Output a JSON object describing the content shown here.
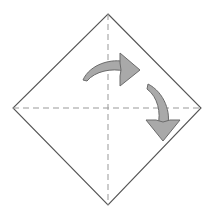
{
  "canvas": {
    "width": 209,
    "height": 214,
    "background_color": "#ffffff",
    "title": "Origami fold step diagram"
  },
  "figure": {
    "name": "diamond-square",
    "stroke_color": "#555555",
    "stroke_width": 1.1,
    "fill": "none",
    "vertices": {
      "top": {
        "x": 108,
        "y": 14
      },
      "left": {
        "x": 13,
        "y": 108
      },
      "right": {
        "x": 201,
        "y": 108
      },
      "bottom": {
        "x": 108,
        "y": 205
      }
    },
    "points_path": "108,14 201,108 108,205 13,108"
  },
  "fold_lines": [
    {
      "name": "vertical-fold-line",
      "orientation": "vertical",
      "style": "dashed",
      "color": "#999999",
      "stroke_width": 1,
      "dash_pattern": "6 4",
      "x1": 108,
      "y1": 14,
      "x2": 108,
      "y2": 205
    },
    {
      "name": "horizontal-fold-line",
      "orientation": "horizontal",
      "style": "dashed",
      "color": "#999999",
      "stroke_width": 1,
      "dash_pattern": "6 4",
      "x1": 13,
      "y1": 108,
      "x2": 201,
      "y2": 108
    }
  ],
  "arrows": [
    {
      "name": "upper-curved-arrow-right",
      "direction": "right",
      "meaning": "rotate / fold toward the right",
      "fill_color": "#a9a9a9",
      "stroke_color": "#6b6b6b",
      "stroke_width": 1,
      "body_path": "M 83 80 C 90 64 112 58 126 62 L 124 71 C 112 68 95 71 87 81 Z",
      "head_path": "M 120 53 L 140 70 L 120 86 L 120 76 L 121 70 L 120 63 Z"
    },
    {
      "name": "right-curved-arrow-down",
      "direction": "down",
      "meaning": "rotate / fold downward",
      "fill_color": "#a9a9a9",
      "stroke_color": "#6b6b6b",
      "stroke_width": 1,
      "body_path": "M 148 84 C 164 92 172 113 167 128 L 158 125 C 161 113 158 97 147 89 Z",
      "head_path": "M 146 120 L 163 141 L 180 120 L 170 120 L 163 122 L 156 120 Z"
    }
  ]
}
